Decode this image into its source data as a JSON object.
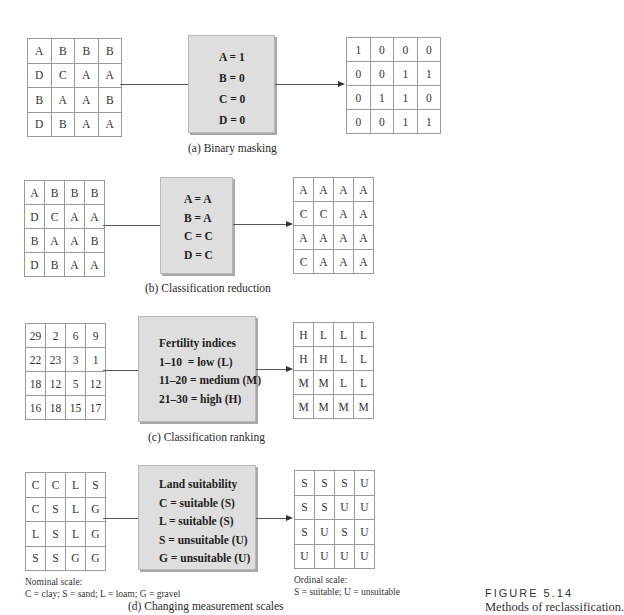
{
  "panels": [
    {
      "id": "a",
      "caption": "(a) Binary masking",
      "input_grid": [
        [
          "A",
          "B",
          "B",
          "B"
        ],
        [
          "D",
          "C",
          "A",
          "A"
        ],
        [
          "B",
          "A",
          "A",
          "B"
        ],
        [
          "D",
          "B",
          "A",
          "A"
        ]
      ],
      "rules": [
        "A = 1",
        "B = 0",
        "C = 0",
        "D = 0"
      ],
      "output_grid": [
        [
          "1",
          "0",
          "0",
          "0"
        ],
        [
          "0",
          "0",
          "1",
          "1"
        ],
        [
          "0",
          "1",
          "1",
          "0"
        ],
        [
          "0",
          "0",
          "1",
          "1"
        ]
      ]
    },
    {
      "id": "b",
      "caption": "(b) Classification reduction",
      "input_grid": [
        [
          "A",
          "B",
          "B",
          "B"
        ],
        [
          "D",
          "C",
          "A",
          "A"
        ],
        [
          "B",
          "A",
          "A",
          "B"
        ],
        [
          "D",
          "B",
          "A",
          "A"
        ]
      ],
      "rules": [
        "A = A",
        "B = A",
        "C = C",
        "D = C"
      ],
      "output_grid": [
        [
          "A",
          "A",
          "A",
          "A"
        ],
        [
          "C",
          "C",
          "A",
          "A"
        ],
        [
          "A",
          "A",
          "A",
          "A"
        ],
        [
          "C",
          "A",
          "A",
          "A"
        ]
      ]
    },
    {
      "id": "c",
      "caption": "(c) Classification ranking",
      "input_grid": [
        [
          "29",
          "2",
          "6",
          "9"
        ],
        [
          "22",
          "23",
          "3",
          "1"
        ],
        [
          "18",
          "12",
          "5",
          "12"
        ],
        [
          "16",
          "18",
          "15",
          "17"
        ]
      ],
      "rules_title": "Fertility indices",
      "rules": [
        "1–10  = low (L)",
        "11–20 = medium (M)",
        "21–30 = high (H)"
      ],
      "output_grid": [
        [
          "H",
          "L",
          "L",
          "L"
        ],
        [
          "H",
          "H",
          "L",
          "L"
        ],
        [
          "M",
          "M",
          "L",
          "L"
        ],
        [
          "M",
          "M",
          "M",
          "M"
        ]
      ]
    },
    {
      "id": "d",
      "caption": "(d) Changing measurement scales",
      "input_grid": [
        [
          "C",
          "C",
          "L",
          "S"
        ],
        [
          "C",
          "S",
          "L",
          "G"
        ],
        [
          "L",
          "S",
          "L",
          "G"
        ],
        [
          "S",
          "S",
          "G",
          "G"
        ]
      ],
      "rules_title": "Land suitability",
      "rules": [
        "C = suitable (S)",
        "L = suitable (S)",
        "S = unsuitable (U)",
        "G = unsuitable (U)"
      ],
      "output_grid": [
        [
          "S",
          "S",
          "S",
          "U"
        ],
        [
          "S",
          "S",
          "U",
          "U"
        ],
        [
          "S",
          "U",
          "S",
          "U"
        ],
        [
          "U",
          "U",
          "U",
          "U"
        ]
      ],
      "input_note": [
        "Nominal scale:",
        "C = clay; S = sand; L = loam; G = gravel"
      ],
      "output_note": [
        "Ordinal scale:",
        "S = suitable; U = unsuitable"
      ]
    }
  ],
  "figure": {
    "label": "FIGURE 5.14",
    "title": "Methods of reclassification."
  }
}
